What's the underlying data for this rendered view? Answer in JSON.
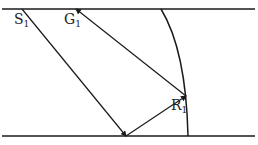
{
  "diagram": {
    "type": "ray-reflection",
    "colors": {
      "line": "#1a1a1a",
      "background": "#ffffff"
    },
    "boundaries": {
      "top": {
        "x1": 2,
        "y": 9,
        "x2": 255
      },
      "bottom": {
        "x1": 2,
        "y": 136,
        "x2": 255
      }
    },
    "curve": {
      "start": [
        161,
        9
      ],
      "control": [
        186,
        50
      ],
      "end": [
        188,
        136
      ]
    },
    "points": {
      "S1": {
        "label": "S",
        "sub": "1",
        "x": 22,
        "y": 9,
        "lx": 14,
        "ly": 24
      },
      "G1": {
        "label": "G",
        "sub": "1",
        "x": 76,
        "y": 9,
        "lx": 64,
        "ly": 24
      },
      "B": {
        "x": 126,
        "y": 136
      },
      "R1": {
        "label": "R",
        "sub": "1",
        "x": 186,
        "y": 96,
        "lx": 171,
        "ly": 110
      }
    },
    "rays": [
      {
        "from": "S1",
        "to": "B",
        "arrow": "end"
      },
      {
        "from": "B",
        "to": "R1",
        "arrow": "end"
      },
      {
        "from": "R1",
        "to": "G1",
        "arrow": "end"
      }
    ]
  }
}
